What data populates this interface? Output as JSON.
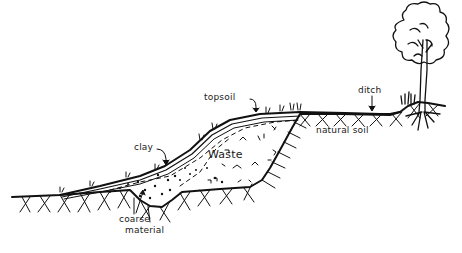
{
  "diagram": {
    "type": "landfill-cross-section",
    "style": "hand-drawn line sketch",
    "ink_color": "#111111",
    "background": "#ffffff",
    "labels": {
      "topsoil": "topsoil",
      "clay": "clay",
      "waste": "Waste",
      "natural_soil": "natural soil",
      "ditch": "ditch",
      "coarse_material_line1": "coarse",
      "coarse_material_line2": "material"
    },
    "elements": [
      {
        "name": "topsoil layer",
        "pointer": "arrow"
      },
      {
        "name": "clay layer",
        "pointer": "arrow"
      },
      {
        "name": "waste fill",
        "pattern": "scattered marks"
      },
      {
        "name": "coarse material",
        "pattern": "dots",
        "pointer": "arrow"
      },
      {
        "name": "natural soil",
        "pattern": "cross-hatch"
      },
      {
        "name": "ditch",
        "pointer": "arrow"
      },
      {
        "name": "tree",
        "position": "right"
      },
      {
        "name": "grass tufts",
        "position": "cap surface"
      }
    ]
  }
}
